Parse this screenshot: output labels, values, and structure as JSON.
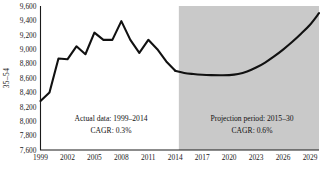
{
  "chart_data": {
    "type": "line",
    "title": "",
    "xlabel": "",
    "ylabel": "35–54",
    "xlim": [
      1999,
      2030
    ],
    "ylim": [
      7600,
      9600
    ],
    "grid": false,
    "legend": "none",
    "x_ticks": [
      "1999",
      "2002",
      "2005",
      "2008",
      "2011",
      "2014",
      "2017",
      "2020",
      "2023",
      "2026",
      "2029"
    ],
    "y_ticks": [
      "7,600",
      "7,800",
      "8,000",
      "8,200",
      "8,400",
      "8,600",
      "8,800",
      "9,000",
      "9,200",
      "9,400",
      "9,600"
    ],
    "series": [
      {
        "name": "Actual data",
        "x": [
          1999,
          2000,
          2001,
          2002,
          2003,
          2004,
          2005,
          2006,
          2007,
          2008,
          2009,
          2010,
          2011,
          2012,
          2013,
          2014
        ],
        "values": [
          8280,
          8400,
          8870,
          8860,
          9040,
          8930,
          9230,
          9130,
          9130,
          9390,
          9130,
          8950,
          9130,
          9000,
          8830,
          8700
        ]
      },
      {
        "name": "Projection period",
        "x": [
          2014,
          2015,
          2016,
          2017,
          2018,
          2019,
          2020,
          2021,
          2022,
          2023,
          2024,
          2025,
          2026,
          2027,
          2028,
          2029,
          2030
        ],
        "values": [
          8700,
          8670,
          8655,
          8645,
          8640,
          8638,
          8640,
          8655,
          8690,
          8745,
          8815,
          8900,
          8995,
          9100,
          9215,
          9340,
          9500
        ]
      }
    ],
    "shaded_region": {
      "from": 2014.4,
      "to": 2030,
      "color": "#c9c9c9"
    },
    "annotations": [
      {
        "name": "actual-annotation",
        "line1": "Actual data: 1999–2014",
        "line2": "CAGR: 0.3%"
      },
      {
        "name": "projection-annotation",
        "line1": "Projection period: 2015–30",
        "line2": "CAGR: 0.6%"
      }
    ]
  }
}
